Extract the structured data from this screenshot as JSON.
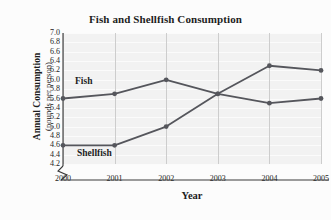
{
  "figure": {
    "title": "Fish and Shellfish Consumption",
    "ylabel_line1": "Annual Consumption",
    "ylabel_line2": "(pounds per person)",
    "xlabel": "Year",
    "series_label_fish": "Fish",
    "series_label_shellfish": "Shellfish",
    "line_color": "#55565c",
    "marker_color": "#55565c",
    "plot_background": "#f2f2f2",
    "figure_background": "#fcfcfc",
    "text_color": "#1d1d1d"
  },
  "chart_data": {
    "type": "line",
    "title": "Fish and Shellfish Consumption",
    "xlabel": "Year",
    "ylabel": "Annual Consumption (pounds per person)",
    "categories": [
      "2000",
      "2001",
      "2002",
      "2003",
      "2004",
      "2005"
    ],
    "x": [
      2000,
      2001,
      2002,
      2003,
      2004,
      2005
    ],
    "series": [
      {
        "name": "Fish",
        "values": [
          5.6,
          5.7,
          6.0,
          5.7,
          5.5,
          5.6
        ]
      },
      {
        "name": "Shellfish",
        "values": [
          4.6,
          4.6,
          5.0,
          5.7,
          6.3,
          6.2
        ]
      }
    ],
    "ylim": [
      4.2,
      7.0
    ],
    "ytick_step": 0.2,
    "yticks": [
      "7.0",
      "6.8",
      "6.6",
      "6.4",
      "6.2",
      "6.0",
      "5.8",
      "5.6",
      "5.4",
      "5.2",
      "5.0",
      "4.8",
      "4.6",
      "4.4",
      "4.2"
    ],
    "xticks": [
      "2000",
      "2001",
      "2002",
      "2003",
      "2004",
      "2005"
    ],
    "xlim": [
      2000,
      2005
    ],
    "grid": true,
    "legend": "inline-labels",
    "y_axis_break": true,
    "marker": "circle"
  }
}
